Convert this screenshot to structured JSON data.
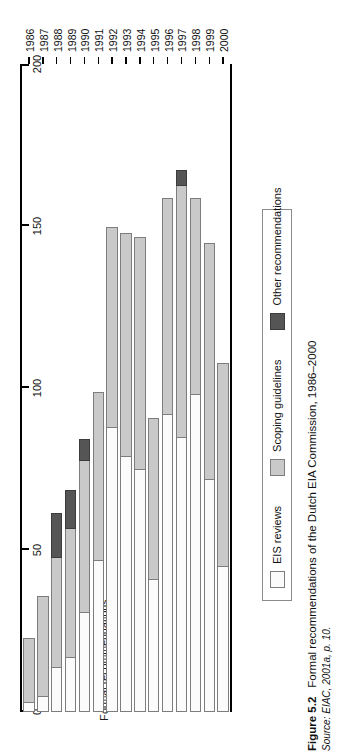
{
  "figure": {
    "number": "Figure 5.2",
    "title": "Formal recommendations of the Dutch EIA Commission, 1986–2000",
    "source_prefix": "Source:",
    "source": "EIAC, 2001a, p. 10."
  },
  "legend": {
    "items": [
      {
        "label": "EIS reviews",
        "color": "#fbfbfb",
        "swatch": "eis"
      },
      {
        "label": "Scoping guidelines",
        "color": "#c9c9c9",
        "swatch": "scoping"
      },
      {
        "label": "Other recommendations",
        "color": "#555555",
        "swatch": "other"
      }
    ]
  },
  "chart_data": {
    "type": "bar",
    "orientation": "horizontal-stacked",
    "title": "Formal recommendations of the Dutch EIA Commission, 1986–2000",
    "xlabel": "",
    "ylabel": "Formal recommendations",
    "ylim": [
      0,
      200
    ],
    "yticks": [
      0,
      50,
      100,
      150,
      200
    ],
    "ytick_labels": [
      "0",
      "50",
      "100",
      "150",
      "200"
    ],
    "grid": false,
    "legend_position": "below-plot",
    "categories": [
      "1986",
      "1987",
      "1988",
      "1989",
      "1990",
      "1991",
      "1992",
      "1993",
      "1994",
      "1995",
      "1996",
      "1997",
      "1998",
      "1999",
      "2000"
    ],
    "series": [
      {
        "name": "EIS reviews",
        "values": [
          3,
          5,
          14,
          17,
          31,
          47,
          88,
          79,
          75,
          41,
          92,
          85,
          98,
          72,
          45
        ]
      },
      {
        "name": "Scoping guidelines",
        "values": [
          20,
          31,
          34,
          40,
          47,
          52,
          62,
          69,
          72,
          50,
          67,
          78,
          61,
          73,
          63
        ]
      },
      {
        "name": "Other recommendations",
        "values": [
          0,
          0,
          14,
          12,
          7,
          0,
          0,
          0,
          0,
          0,
          0,
          5,
          0,
          0,
          0
        ]
      }
    ],
    "totals": [
      23,
      36,
      62,
      69,
      85,
      99,
      150,
      148,
      147,
      91,
      159,
      168,
      159,
      145,
      108
    ]
  }
}
